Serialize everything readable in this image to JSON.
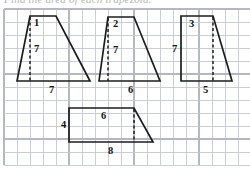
{
  "page": {
    "header_fragment": "Find the area of each trapezoid.",
    "background_color": "#ffffff",
    "ink_color": "#1d1d1d",
    "grid_color": "#c5c9d1"
  },
  "grid": {
    "cell_size": 13,
    "origin_x": 4,
    "origin_y": 9,
    "columns": 19,
    "rows": 12,
    "visible": true
  },
  "figures": [
    {
      "id": "trapezoid-1",
      "name": "trapezoid-1",
      "points": "17,81 30,16 56,16 90,81",
      "dashed_height": "30,17 30,81",
      "labels": [
        {
          "name": "top-base-label",
          "text": "1",
          "x": 34,
          "y": 26
        },
        {
          "name": "height-label",
          "text": "7",
          "x": 34,
          "y": 52
        },
        {
          "name": "bottom-base-label",
          "text": "7",
          "x": 49,
          "y": 93
        }
      ]
    },
    {
      "id": "trapezoid-2",
      "name": "trapezoid-2",
      "points": "99,81 108,17 134,17 160,81",
      "dashed_height": "108,18 108,81",
      "labels": [
        {
          "name": "top-base-label",
          "text": "2",
          "x": 113,
          "y": 27
        },
        {
          "name": "height-label",
          "text": "7",
          "x": 113,
          "y": 53
        },
        {
          "name": "bottom-base-label",
          "text": "6",
          "x": 128,
          "y": 93
        }
      ]
    },
    {
      "id": "trapezoid-3",
      "name": "trapezoid-3",
      "points": "181,81 181,16 213,16 232,81",
      "dashed_height": "213,17 213,81",
      "labels": [
        {
          "name": "top-base-label",
          "text": "3",
          "x": 189,
          "y": 27
        },
        {
          "name": "height-label",
          "text": "7",
          "x": 172,
          "y": 52
        },
        {
          "name": "bottom-base-label",
          "text": "5",
          "x": 203,
          "y": 93
        }
      ]
    },
    {
      "id": "trapezoid-4",
      "name": "trapezoid-4",
      "points": "69,142 69,108 134,108 153,142",
      "dashed_height": "134,109 134,142",
      "labels": [
        {
          "name": "left-side-label",
          "text": "4",
          "x": 61,
          "y": 128
        },
        {
          "name": "top-base-label",
          "text": "6",
          "x": 101,
          "y": 119
        },
        {
          "name": "bottom-base-label",
          "text": "8",
          "x": 108,
          "y": 154
        }
      ]
    }
  ]
}
